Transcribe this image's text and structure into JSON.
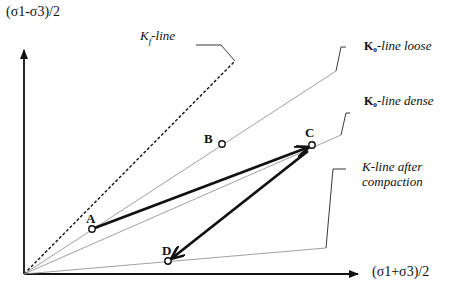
{
  "axes": {
    "y_label": "(σ1-σ3)/2",
    "x_label": "(σ1+σ3)/2"
  },
  "lines": {
    "kf": {
      "label_prefix": "K",
      "label_sub": "f",
      "label_suffix": "-line",
      "style": "dashed"
    },
    "k0_loose": {
      "label_prefix": "K₀",
      "label_suffix": "-line loose",
      "style": "thin"
    },
    "k0_dense": {
      "label_prefix": "K₀",
      "label_suffix": "-line dense",
      "style": "thin"
    },
    "k_after": {
      "label_line1": "K-line after",
      "label_line2": "compaction",
      "style": "thin"
    }
  },
  "points": {
    "A": {
      "label": "A"
    },
    "B": {
      "label": "B"
    },
    "C": {
      "label": "C"
    },
    "D": {
      "label": "D"
    }
  },
  "paths": [
    {
      "from": "A",
      "to": "C",
      "style": "thick-arrow"
    },
    {
      "from": "C",
      "to": "D",
      "style": "thick-arrow"
    }
  ],
  "colors": {
    "ink": "#111111",
    "thin_line": "#888888",
    "background": "#ffffff"
  }
}
